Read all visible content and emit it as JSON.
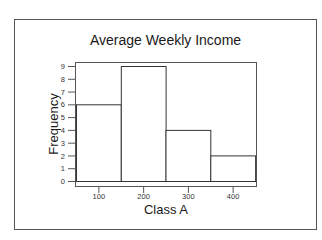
{
  "chart_data": {
    "type": "bar",
    "subtype": "histogram",
    "title": "Average Weekly Income",
    "xlabel": "Class A",
    "ylabel": "Frequency",
    "categories": [
      "50-150",
      "150-250",
      "250-350",
      "350-450"
    ],
    "bin_edges": [
      50,
      150,
      250,
      350,
      450
    ],
    "values": [
      6,
      9,
      4,
      2
    ],
    "x_ticks": [
      100,
      200,
      300,
      400
    ],
    "y_ticks": [
      0,
      1,
      2,
      3,
      4,
      5,
      6,
      7,
      8,
      9
    ],
    "ylim": [
      0,
      9
    ],
    "xlim": [
      50,
      450
    ],
    "grid": false,
    "legend": null,
    "colors": {
      "bar_fill": "#ffffff",
      "bar_edge": "#333333",
      "axis": "#555555",
      "frame": "#555555"
    }
  }
}
